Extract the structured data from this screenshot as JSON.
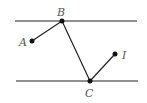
{
  "diagram": {
    "lines": [
      {
        "name": "top-parallel-line",
        "x1": 15,
        "y1": 21,
        "x2": 137,
        "y2": 21
      },
      {
        "name": "bottom-parallel-line",
        "x1": 16,
        "y1": 81,
        "x2": 138,
        "y2": 81
      }
    ],
    "points": [
      {
        "label": "A",
        "x": 32,
        "y": 41
      },
      {
        "label": "B",
        "x": 62,
        "y": 21
      },
      {
        "label": "C",
        "x": 90,
        "y": 81
      },
      {
        "label": "I",
        "x": 115,
        "y": 54
      }
    ],
    "segments": [
      "A-B",
      "B-C",
      "C-I"
    ],
    "labels": {
      "A": "A",
      "B": "B",
      "C": "C",
      "I": "I"
    },
    "colors": {
      "stroke": "#222222",
      "label": "#555555"
    }
  }
}
